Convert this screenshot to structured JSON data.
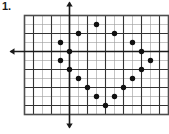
{
  "problem": {
    "number_label": "1."
  },
  "figure": {
    "name": "coordinate-grid-scatter-plot",
    "colors": {
      "minor_grid": "#9a9a9a",
      "major_grid": "#333333",
      "border": "#4d4d4d",
      "axis": "#1a1a1a",
      "dot": "#111111",
      "background": "#ffffff"
    },
    "grid": {
      "columns": 16,
      "rows": 11,
      "cell_size_px": 9,
      "major_every": 2,
      "origin_col": 5,
      "origin_row": 4,
      "x_axis_arrows": [
        "left",
        "right"
      ],
      "y_axis_arrows": [
        "up",
        "down"
      ]
    }
  },
  "chart_data": {
    "type": "scatter",
    "title": "",
    "xlabel": "",
    "ylabel": "",
    "xlim": [
      -5,
      11
    ],
    "ylim": [
      -7,
      4
    ],
    "grid": true,
    "legend": null,
    "axis_tick_labels": [],
    "x": [
      3,
      1,
      5,
      -1,
      7,
      0,
      8,
      -1,
      9,
      0,
      8,
      1,
      7,
      2,
      6,
      3,
      5,
      4
    ],
    "y": [
      3,
      2,
      2,
      1,
      1,
      0,
      0,
      -1,
      -1,
      -2,
      -2,
      -3,
      -3,
      -4,
      -4,
      -5,
      -5,
      -6
    ],
    "points": [
      {
        "x": 3,
        "y": 3
      },
      {
        "x": 1,
        "y": 2
      },
      {
        "x": 5,
        "y": 2
      },
      {
        "x": -1,
        "y": 1
      },
      {
        "x": 7,
        "y": 1
      },
      {
        "x": 0,
        "y": 0
      },
      {
        "x": 8,
        "y": 0
      },
      {
        "x": -1,
        "y": -1
      },
      {
        "x": 9,
        "y": -1
      },
      {
        "x": 0,
        "y": -2
      },
      {
        "x": 8,
        "y": -2
      },
      {
        "x": 1,
        "y": -3
      },
      {
        "x": 7,
        "y": -3
      },
      {
        "x": 2,
        "y": -4
      },
      {
        "x": 6,
        "y": -4
      },
      {
        "x": 3,
        "y": -5
      },
      {
        "x": 5,
        "y": -5
      },
      {
        "x": 4,
        "y": -6
      }
    ],
    "point_count": 18
  }
}
